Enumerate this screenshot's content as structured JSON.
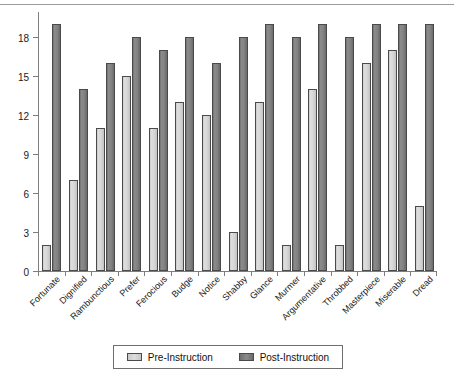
{
  "chart_data": {
    "type": "bar",
    "title": "",
    "subtitle": "",
    "xlabel": "",
    "ylabel": "",
    "ylim": [
      0,
      20
    ],
    "yticks": [
      0,
      3,
      6,
      9,
      12,
      15,
      18
    ],
    "grid": false,
    "legend_position": "bottom",
    "categories": [
      "Fortunate",
      "Dignified",
      "Rambunctious",
      "Prefer",
      "Ferocious",
      "Budge",
      "Notice",
      "Shabby",
      "Glance",
      "Murmer",
      "Argumentative",
      "Throbbed",
      "Masterpiece",
      "Miserable",
      "Dread"
    ],
    "series": [
      {
        "name": "Pre-Instruction",
        "color": "#d6d6d6",
        "values": [
          2,
          7,
          11,
          15,
          11,
          13,
          12,
          3,
          13,
          2,
          14,
          2,
          16,
          17,
          5
        ]
      },
      {
        "name": "Post-Instruction",
        "color": "#808080",
        "values": [
          19,
          14,
          16,
          18,
          17,
          18,
          16,
          18,
          19,
          18,
          19,
          18,
          19,
          19,
          19
        ]
      }
    ]
  },
  "legend": {
    "items": [
      {
        "label": "Pre-Instruction",
        "swatch": "light-gray"
      },
      {
        "label": "Post-Instruction",
        "swatch": "dark-gray"
      }
    ]
  }
}
